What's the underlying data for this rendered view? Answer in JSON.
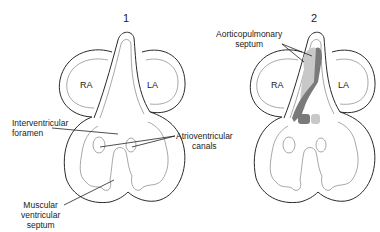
{
  "panels": [
    {
      "number": "1",
      "chambers": {
        "right_atrium": "RA",
        "left_atrium": "LA"
      },
      "labels": {
        "interventricular_foramen": [
          "Interventricular",
          "foramen"
        ],
        "atrioventricular_canals": [
          "Atrioventricular",
          "canals"
        ],
        "muscular_ventricular_septum": [
          "Muscular",
          "ventricular",
          "septum"
        ]
      }
    },
    {
      "number": "2",
      "chambers": {
        "right_atrium": "RA",
        "left_atrium": "LA"
      },
      "labels": {
        "aorticopulmonary_septum": [
          "Aorticopulmonary",
          "septum"
        ]
      }
    }
  ],
  "colors": {
    "outline": "#2a2a2a",
    "inner_outline": "#a8a8a8",
    "septum_dark": "#7a7a7a",
    "septum_light": "#c8c8c8"
  }
}
